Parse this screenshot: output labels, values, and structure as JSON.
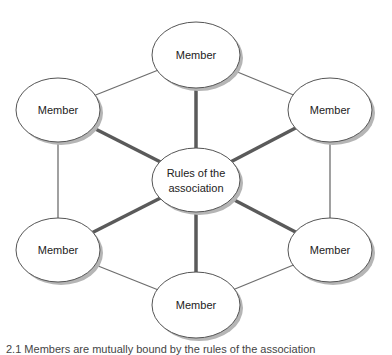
{
  "diagram": {
    "center": {
      "label_line1": "Rules of the",
      "label_line2": "association"
    },
    "members": [
      {
        "label": "Member",
        "position": "top"
      },
      {
        "label": "Member",
        "position": "upper-right"
      },
      {
        "label": "Member",
        "position": "lower-right"
      },
      {
        "label": "Member",
        "position": "bottom"
      },
      {
        "label": "Member",
        "position": "lower-left"
      },
      {
        "label": "Member",
        "position": "upper-left"
      }
    ],
    "colors": {
      "spoke": "#5a5a5a",
      "ring": "#6e6e6e",
      "node_stroke": "#555555",
      "shadow": "#b5b5b5"
    }
  },
  "caption": "2.1 Members are mutually bound by the rules of the association"
}
